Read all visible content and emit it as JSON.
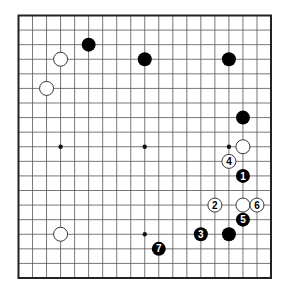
{
  "diagram": {
    "type": "go-board",
    "size": 19,
    "board": {
      "left": 18.5,
      "top": 15.5,
      "right": 271,
      "bottom": 278,
      "line_color": "#555555",
      "border_color": "#222222",
      "background": "#ffffff"
    },
    "star_points": [
      [
        3,
        3
      ],
      [
        9,
        3
      ],
      [
        15,
        3
      ],
      [
        3,
        9
      ],
      [
        9,
        9
      ],
      [
        15,
        9
      ],
      [
        3,
        15
      ],
      [
        9,
        15
      ],
      [
        15,
        15
      ]
    ],
    "stones": [
      {
        "color": "black",
        "col": 5,
        "row": 2,
        "label": ""
      },
      {
        "color": "white",
        "col": 3,
        "row": 3,
        "label": ""
      },
      {
        "color": "white",
        "col": 2,
        "row": 5,
        "label": ""
      },
      {
        "color": "black",
        "col": 9,
        "row": 3,
        "label": ""
      },
      {
        "color": "black",
        "col": 15,
        "row": 3,
        "label": ""
      },
      {
        "color": "black",
        "col": 16,
        "row": 7,
        "label": ""
      },
      {
        "color": "white",
        "col": 16,
        "row": 9,
        "label": ""
      },
      {
        "color": "white",
        "col": 15,
        "row": 10,
        "label": "4"
      },
      {
        "color": "black",
        "col": 16,
        "row": 11,
        "label": "1"
      },
      {
        "color": "white",
        "col": 14,
        "row": 13,
        "label": "2"
      },
      {
        "color": "white",
        "col": 16,
        "row": 13,
        "label": ""
      },
      {
        "color": "white",
        "col": 17,
        "row": 13,
        "label": "6"
      },
      {
        "color": "black",
        "col": 16,
        "row": 14,
        "label": "5"
      },
      {
        "color": "black",
        "col": 13,
        "row": 15,
        "label": "3"
      },
      {
        "color": "black",
        "col": 15,
        "row": 15,
        "label": ""
      },
      {
        "color": "white",
        "col": 3,
        "row": 15,
        "label": ""
      },
      {
        "color": "black",
        "col": 10,
        "row": 16,
        "label": "7"
      }
    ],
    "colors": {
      "black_stone": "#000000",
      "white_stone": "#ffffff",
      "white_stone_outline": "#222222",
      "star_point": "#111111"
    }
  }
}
